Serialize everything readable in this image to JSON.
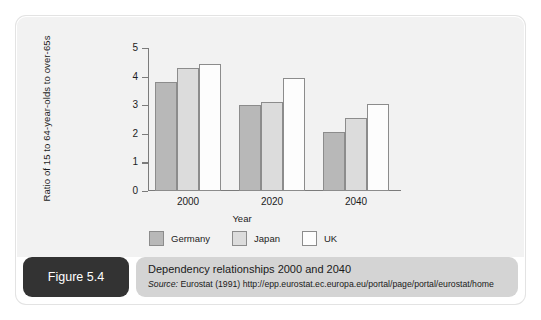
{
  "figure": {
    "badge_label": "Figure 5.4",
    "caption_title": "Dependency relationships 2000 and 2040",
    "source_prefix": "Source:",
    "source_text": "Eurostat (1991) http://epp.eurostat.ec.europa.eu/portal/page/portal/eurostat/home"
  },
  "colors": {
    "germany": "#b8b8b8",
    "japan": "#dcdcdc",
    "uk": "#fdfdfd",
    "bar_border": "#8c8c8c",
    "panel_bg": "#f2f2f2",
    "caption_bg": "#d4d4d4",
    "badge_bg": "#333333"
  },
  "chart_data": {
    "type": "bar",
    "title": "Dependency relationships 2000 and 2040",
    "xlabel": "Year",
    "ylabel": "Ratio of 15 to 64-year-olds to over-65s",
    "categories": [
      "2000",
      "2020",
      "2040"
    ],
    "series": [
      {
        "name": "Germany",
        "color": "#b8b8b8",
        "values": [
          3.8,
          3.0,
          2.05
        ]
      },
      {
        "name": "Japan",
        "color": "#dcdcdc",
        "values": [
          4.3,
          3.1,
          2.55
        ]
      },
      {
        "name": "UK",
        "color": "#fdfdfd",
        "values": [
          4.45,
          3.95,
          3.05
        ]
      }
    ],
    "ylim": [
      0,
      5
    ],
    "yticks": [
      0,
      1,
      2,
      3,
      4,
      5
    ],
    "ytick_labels": [
      "0",
      "1",
      "2",
      "3",
      "4",
      "5"
    ],
    "grid": false,
    "legend_position": "bottom"
  }
}
